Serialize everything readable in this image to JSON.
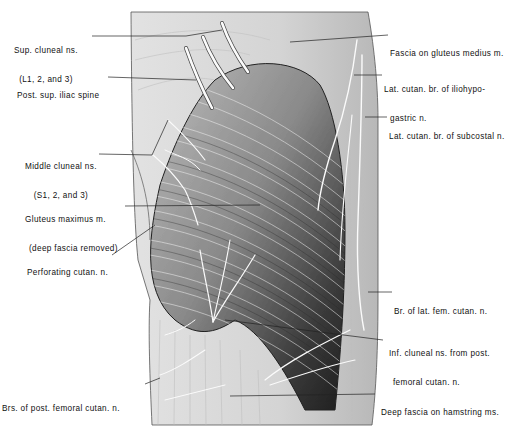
{
  "figure": {
    "colors": {
      "background": "#ffffff",
      "ink": "#111111",
      "muscle_dark": "#3a3a3a",
      "fascia": "#d8d8d8",
      "nerve": "#fafafa"
    }
  },
  "labels": {
    "left": [
      {
        "id": "sup-cluneal",
        "line1": "Sup. cluneal ns.",
        "line2": "(L1, 2, and 3)"
      },
      {
        "id": "post-sup-iliac-spine",
        "line1": "Post. sup. iliac spine",
        "line2": ""
      },
      {
        "id": "middle-cluneal",
        "line1": "Middle cluneal ns.",
        "line2": "(S1, 2, and 3)"
      },
      {
        "id": "gluteus-maximus",
        "line1": "Gluteus maximus m.",
        "line2": "(deep fascia removed)"
      },
      {
        "id": "perforating-cutan",
        "line1": "Perforating cutan. n.",
        "line2": ""
      },
      {
        "id": "brs-post-femoral",
        "line1": "Brs. of post. femoral cutan. n.",
        "line2": ""
      }
    ],
    "right": [
      {
        "id": "fascia-gluteus-medius",
        "line1": "Fascia on gluteus medius m.",
        "line2": ""
      },
      {
        "id": "lat-cutan-iliohypogastric",
        "line1": "Lat. cutan. br. of iliohypo-",
        "line2": "gastric n."
      },
      {
        "id": "lat-cutan-subcostal",
        "line1": "Lat. cutan. br. of subcostal n.",
        "line2": ""
      },
      {
        "id": "br-lat-fem-cutan",
        "line1": "Br. of lat. fem. cutan. n.",
        "line2": ""
      },
      {
        "id": "inf-cluneal",
        "line1": "Inf. cluneal ns. from post.",
        "line2": "femoral cutan. n."
      },
      {
        "id": "deep-fascia-hamstring",
        "line1": "Deep fascia on hamstring ms.",
        "line2": ""
      }
    ]
  }
}
